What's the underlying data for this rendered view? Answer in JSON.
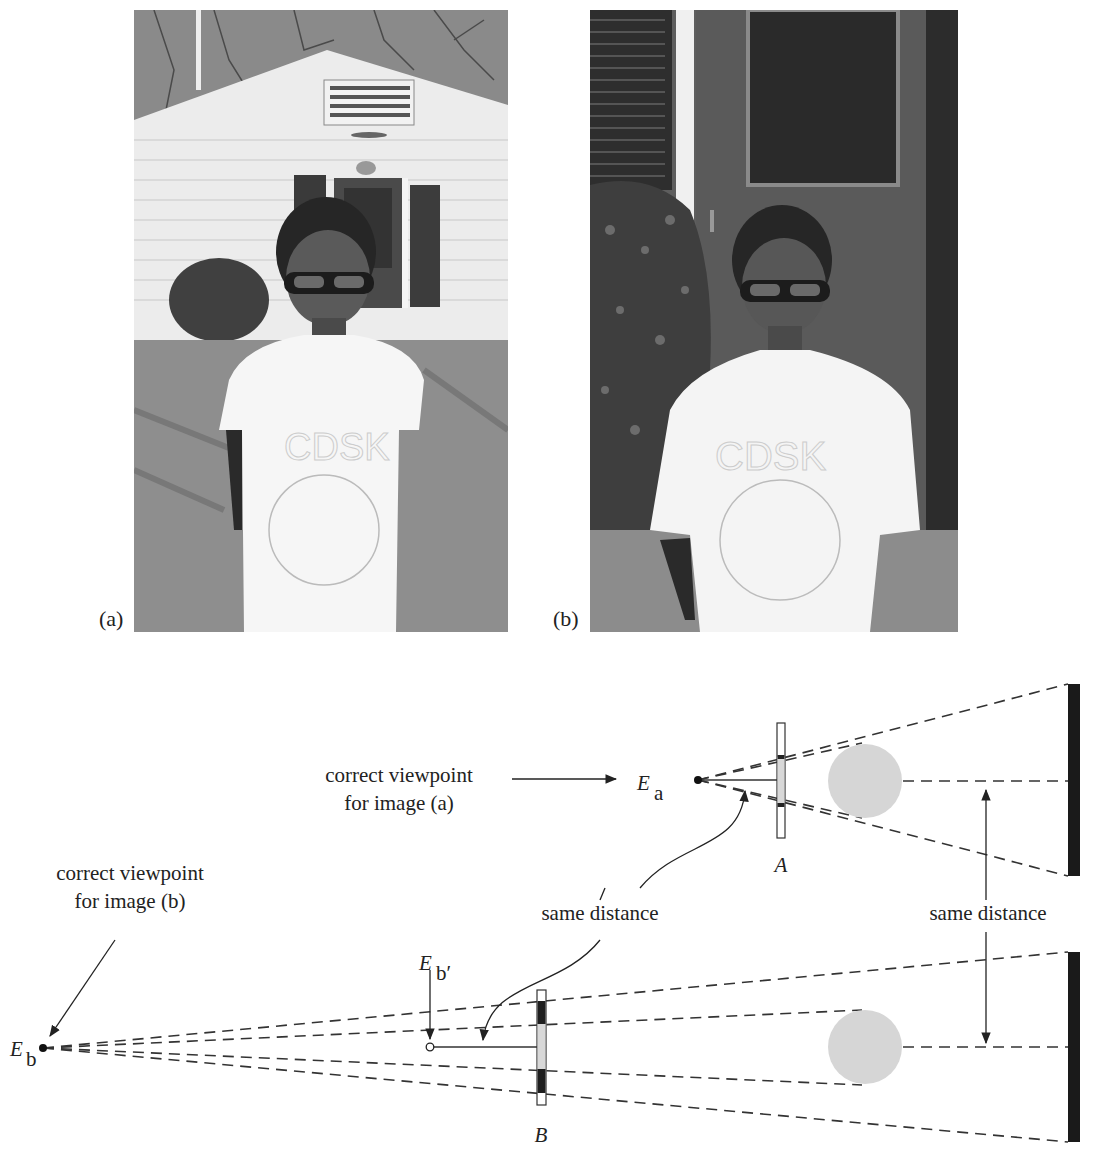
{
  "photos": {
    "a": {
      "label": "(a)",
      "description": "Boy in white t-shirt and glasses standing on a lawn in front of a white-sided shed with a dark door flanked by shutters, bare trees above; taken from farther away with a wide view"
    },
    "b": {
      "label": "(b)",
      "description": "Same boy photographed from farther away with a longer focal length; background of dark door, shutter and shrub appears magnified"
    }
  },
  "diagram": {
    "top": {
      "viewpoint_caption_line1": "correct viewpoint",
      "viewpoint_caption_line2": "for image (a)",
      "eye_label": "E",
      "eye_subscript": "a",
      "screen_label": "A"
    },
    "bottom": {
      "viewpoint_caption_line1": "correct viewpoint",
      "viewpoint_caption_line2": "for image (b)",
      "eye_label": "E",
      "eye_subscript": "b",
      "eye_prime_label": "E",
      "eye_prime_subscript": "b′",
      "screen_label": "B"
    },
    "annotations": {
      "same_distance_left": "same distance",
      "same_distance_right": "same distance"
    },
    "colors": {
      "line": "#333333",
      "subject_circle": "#d6d6d6",
      "wall": "#1a1a1a",
      "screen_fill": "#e2e2e2"
    }
  }
}
